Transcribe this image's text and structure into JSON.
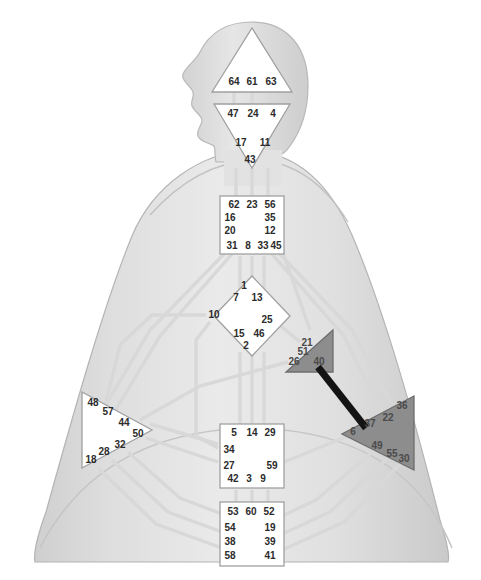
{
  "graph": {
    "title": "Human Design BodyGraph",
    "colors": {
      "background": "#ffffff",
      "body_light": "#dcdcdc",
      "body_mid": "#c9c9c9",
      "body_edge": "#b0b0b0",
      "center_undefined_fill": "#ffffff",
      "center_undefined_stroke": "#9a9a9a",
      "center_defined_fill": "#8f8f8f",
      "center_defined_stroke": "#6a6a6a",
      "channel_undefined": "#d6d6d6",
      "channel_defined": "#141414",
      "gate_text": "#2b2b2b"
    }
  },
  "centers": [
    {
      "key": "head",
      "name": "Head",
      "shape": "triangle-up",
      "defined": false,
      "gates": [
        {
          "num": "64",
          "x": 234,
          "y": 82
        },
        {
          "num": "61",
          "x": 252,
          "y": 82
        },
        {
          "num": "63",
          "x": 271,
          "y": 82
        }
      ]
    },
    {
      "key": "ajna",
      "name": "Ajna",
      "shape": "triangle-down",
      "defined": false,
      "gates": [
        {
          "num": "47",
          "x": 233,
          "y": 114
        },
        {
          "num": "24",
          "x": 253,
          "y": 114
        },
        {
          "num": "4",
          "x": 273,
          "y": 114
        },
        {
          "num": "17",
          "x": 241,
          "y": 143
        },
        {
          "num": "11",
          "x": 265,
          "y": 143
        },
        {
          "num": "43",
          "x": 250,
          "y": 160
        }
      ]
    },
    {
      "key": "throat",
      "name": "Throat",
      "shape": "square",
      "defined": false,
      "gates": [
        {
          "num": "62",
          "x": 234,
          "y": 205
        },
        {
          "num": "23",
          "x": 252,
          "y": 205
        },
        {
          "num": "56",
          "x": 270,
          "y": 205
        },
        {
          "num": "16",
          "x": 230,
          "y": 218
        },
        {
          "num": "35",
          "x": 270,
          "y": 218
        },
        {
          "num": "20",
          "x": 230,
          "y": 231
        },
        {
          "num": "12",
          "x": 270,
          "y": 231
        },
        {
          "num": "31",
          "x": 232,
          "y": 246
        },
        {
          "num": "8",
          "x": 248,
          "y": 246
        },
        {
          "num": "33",
          "x": 263,
          "y": 246
        },
        {
          "num": "45",
          "x": 276,
          "y": 246
        }
      ]
    },
    {
      "key": "g",
      "name": "G Center",
      "shape": "diamond",
      "defined": false,
      "gates": [
        {
          "num": "1",
          "x": 244,
          "y": 286
        },
        {
          "num": "7",
          "x": 236,
          "y": 298
        },
        {
          "num": "13",
          "x": 257,
          "y": 298
        },
        {
          "num": "10",
          "x": 214,
          "y": 315
        },
        {
          "num": "25",
          "x": 267,
          "y": 320
        },
        {
          "num": "15",
          "x": 239,
          "y": 334
        },
        {
          "num": "46",
          "x": 259,
          "y": 334
        },
        {
          "num": "2",
          "x": 246,
          "y": 346
        }
      ]
    },
    {
      "key": "heart",
      "name": "Heart / Ego",
      "shape": "triangle-left",
      "defined": true,
      "gates": [
        {
          "num": "21",
          "x": 307,
          "y": 343
        },
        {
          "num": "51",
          "x": 303,
          "y": 352
        },
        {
          "num": "26",
          "x": 294,
          "y": 362
        },
        {
          "num": "40",
          "x": 319,
          "y": 362
        }
      ]
    },
    {
      "key": "spleen",
      "name": "Spleen",
      "shape": "triangle-right",
      "defined": false,
      "gates": [
        {
          "num": "48",
          "x": 93,
          "y": 403
        },
        {
          "num": "57",
          "x": 108,
          "y": 412
        },
        {
          "num": "44",
          "x": 124,
          "y": 423
        },
        {
          "num": "50",
          "x": 138,
          "y": 434
        },
        {
          "num": "32",
          "x": 120,
          "y": 445
        },
        {
          "num": "28",
          "x": 104,
          "y": 452
        },
        {
          "num": "18",
          "x": 91,
          "y": 460
        }
      ]
    },
    {
      "key": "solar_plexus",
      "name": "Solar Plexus",
      "shape": "triangle-left",
      "defined": true,
      "gates": [
        {
          "num": "36",
          "x": 402,
          "y": 406
        },
        {
          "num": "22",
          "x": 388,
          "y": 418
        },
        {
          "num": "37",
          "x": 370,
          "y": 424
        },
        {
          "num": "6",
          "x": 353,
          "y": 432
        },
        {
          "num": "49",
          "x": 377,
          "y": 446
        },
        {
          "num": "55",
          "x": 392,
          "y": 454
        },
        {
          "num": "30",
          "x": 404,
          "y": 459
        }
      ]
    },
    {
      "key": "sacral",
      "name": "Sacral",
      "shape": "square",
      "defined": false,
      "gates": [
        {
          "num": "5",
          "x": 234,
          "y": 433
        },
        {
          "num": "14",
          "x": 252,
          "y": 433
        },
        {
          "num": "29",
          "x": 270,
          "y": 433
        },
        {
          "num": "34",
          "x": 229,
          "y": 450
        },
        {
          "num": "27",
          "x": 229,
          "y": 466
        },
        {
          "num": "59",
          "x": 272,
          "y": 466
        },
        {
          "num": "42",
          "x": 233,
          "y": 479
        },
        {
          "num": "3",
          "x": 249,
          "y": 479
        },
        {
          "num": "9",
          "x": 263,
          "y": 479
        }
      ]
    },
    {
      "key": "root",
      "name": "Root",
      "shape": "square",
      "defined": false,
      "gates": [
        {
          "num": "53",
          "x": 233,
          "y": 512
        },
        {
          "num": "60",
          "x": 251,
          "y": 512
        },
        {
          "num": "52",
          "x": 269,
          "y": 512
        },
        {
          "num": "54",
          "x": 230,
          "y": 528
        },
        {
          "num": "19",
          "x": 270,
          "y": 528
        },
        {
          "num": "38",
          "x": 230,
          "y": 542
        },
        {
          "num": "39",
          "x": 270,
          "y": 542
        },
        {
          "num": "58",
          "x": 230,
          "y": 556
        },
        {
          "num": "41",
          "x": 270,
          "y": 556
        }
      ]
    }
  ],
  "channels": [
    {
      "key": "37-40",
      "gates": "37-40",
      "defined": true
    },
    {
      "key": "64-47",
      "gates": "64-47",
      "defined": false
    },
    {
      "key": "61-24",
      "gates": "61-24",
      "defined": false
    },
    {
      "key": "63-4",
      "gates": "63-4",
      "defined": false
    },
    {
      "key": "17-62",
      "gates": "17-62",
      "defined": false
    },
    {
      "key": "43-23",
      "gates": "43-23",
      "defined": false
    },
    {
      "key": "11-56",
      "gates": "11-56",
      "defined": false
    },
    {
      "key": "16-48",
      "gates": "16-48",
      "defined": false
    },
    {
      "key": "20-57",
      "gates": "20-57",
      "defined": false
    },
    {
      "key": "20-34",
      "gates": "20-34",
      "defined": false
    },
    {
      "key": "20-10",
      "gates": "20-10",
      "defined": false
    },
    {
      "key": "35-36",
      "gates": "35-36",
      "defined": false
    },
    {
      "key": "12-22",
      "gates": "12-22",
      "defined": false
    },
    {
      "key": "31-7",
      "gates": "31-7",
      "defined": false
    },
    {
      "key": "8-1",
      "gates": "8-1",
      "defined": false
    },
    {
      "key": "33-13",
      "gates": "33-13",
      "defined": false
    },
    {
      "key": "45-21",
      "gates": "45-21",
      "defined": false
    },
    {
      "key": "10-34",
      "gates": "10-34",
      "defined": false
    },
    {
      "key": "10-57",
      "gates": "10-57",
      "defined": false
    },
    {
      "key": "25-51",
      "gates": "25-51",
      "defined": false
    },
    {
      "key": "15-5",
      "gates": "15-5",
      "defined": false
    },
    {
      "key": "2-14",
      "gates": "2-14",
      "defined": false
    },
    {
      "key": "46-29",
      "gates": "46-29",
      "defined": false
    },
    {
      "key": "26-44",
      "gates": "26-44",
      "defined": false
    },
    {
      "key": "21-45",
      "gates": "21-45",
      "defined": false
    },
    {
      "key": "50-27",
      "gates": "50-27",
      "defined": false
    },
    {
      "key": "32-54",
      "gates": "32-54",
      "defined": false
    },
    {
      "key": "28-38",
      "gates": "28-38",
      "defined": false
    },
    {
      "key": "18-58",
      "gates": "18-58",
      "defined": false
    },
    {
      "key": "6-59",
      "gates": "6-59",
      "defined": false
    },
    {
      "key": "49-19",
      "gates": "49-19",
      "defined": false
    },
    {
      "key": "55-39",
      "gates": "55-39",
      "defined": false
    },
    {
      "key": "30-41",
      "gates": "30-41",
      "defined": false
    },
    {
      "key": "53-42",
      "gates": "53-42",
      "defined": false
    },
    {
      "key": "60-3",
      "gates": "60-3",
      "defined": false
    },
    {
      "key": "52-9",
      "gates": "52-9",
      "defined": false
    },
    {
      "key": "34-57",
      "gates": "34-57",
      "defined": false
    }
  ]
}
